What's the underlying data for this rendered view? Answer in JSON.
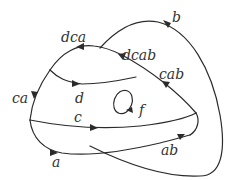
{
  "diagram": {
    "type": "directed curve diagram",
    "stroke_color": "#2b2b2b",
    "background": "#ffffff",
    "labels": {
      "b": "b",
      "dca": "dca",
      "dcab": "dcab",
      "cab": "cab",
      "ca": "ca",
      "d": "d",
      "f": "f",
      "c": "c",
      "a": "a",
      "ab": "ab"
    },
    "edges": [
      {
        "id": "b",
        "label": "b",
        "direction": "clockwise outer loop"
      },
      {
        "id": "dca",
        "label": "dca",
        "direction": "right-to-left along top arc"
      },
      {
        "id": "dcab",
        "label": "dcab",
        "direction": "up-left along diagonal"
      },
      {
        "id": "cab",
        "label": "cab",
        "direction": "up-left along diagonal"
      },
      {
        "id": "ca",
        "label": "ca",
        "direction": "downward along left arc"
      },
      {
        "id": "d",
        "label": "d",
        "direction": "left-to-right"
      },
      {
        "id": "f",
        "label": "f",
        "direction": "small closed loop"
      },
      {
        "id": "c",
        "label": "c",
        "direction": "left-to-right"
      },
      {
        "id": "a",
        "label": "a",
        "direction": "left-to-right"
      },
      {
        "id": "ab",
        "label": "ab",
        "direction": "left-to-right, upward"
      }
    ]
  }
}
